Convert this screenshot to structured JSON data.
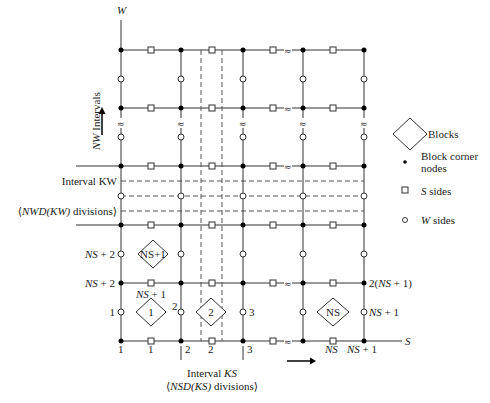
{
  "axes": {
    "w_label": "W",
    "s_label": "S",
    "nw_intervals_label_italic": "NW",
    "nw_intervals_label_rest": " Intervals"
  },
  "left_labels": {
    "interval_kw": "Interval KW",
    "nwd_divisions_pre": "⟨",
    "nwd_divisions_italic": "NWD(KW)",
    "nwd_divisions_post": " divisions⟩",
    "ns_plus_2_upper_italic": "NS",
    "ns_plus_2_upper_rest": " + 2",
    "ns_plus_2_lower_italic": "NS",
    "ns_plus_2_lower_rest": " + 2",
    "one": "1"
  },
  "inner_labels": {
    "ns_plus_1_italic": "NS",
    "ns_plus_1_rest": " + 1",
    "two": "2",
    "three": "3"
  },
  "right_labels": {
    "two_ns_plus_1_pre": "2(",
    "two_ns_plus_1_italic": "NS",
    "two_ns_plus_1_post": " + 1)",
    "ns_plus_1_italic": "NS",
    "ns_plus_1_rest": " + 1"
  },
  "bottom_labels": {
    "b1": "1",
    "b1s": "1",
    "b2": "2",
    "b2s": "2",
    "b3": "3",
    "ns_italic": "NS",
    "ns_plus_1_italic": "NS",
    "ns_plus_1_rest": " + 1",
    "interval_ks_pre": "Interval ",
    "interval_ks_italic": "KS",
    "nsd_pre": "⟨",
    "nsd_italic": "NSD(KS)",
    "nsd_post": " divisions⟩"
  },
  "blocks": [
    {
      "label": "NS+1"
    },
    {
      "label": "1"
    },
    {
      "label": "2"
    },
    {
      "label": "NS"
    }
  ],
  "legend": {
    "blocks": "Blocks",
    "corner_nodes_line1": "Block corner",
    "corner_nodes_line2": "nodes",
    "s_sides_italic": "S",
    "s_sides_rest": " sides",
    "w_sides_italic": "W",
    "w_sides_rest": " sides"
  },
  "break_symbol": "≈"
}
